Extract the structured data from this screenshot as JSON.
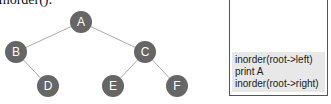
{
  "title": "Inorder():",
  "tree": {
    "nodes": [
      {
        "id": "A",
        "x": 81,
        "y": 22
      },
      {
        "id": "B",
        "x": 16,
        "y": 52
      },
      {
        "id": "C",
        "x": 145,
        "y": 52
      },
      {
        "id": "D",
        "x": 48,
        "y": 86
      },
      {
        "id": "E",
        "x": 113,
        "y": 86
      },
      {
        "id": "F",
        "x": 177,
        "y": 86
      }
    ],
    "edges": [
      [
        "A",
        "B"
      ],
      [
        "A",
        "C"
      ],
      [
        "B",
        "D"
      ],
      [
        "C",
        "E"
      ],
      [
        "C",
        "F"
      ]
    ],
    "node_color": "#666666",
    "edge_color": "#aaaaaa"
  },
  "stack": {
    "frame_lines": [
      "inorder(root->left)",
      "print A",
      "inorder(root->right)"
    ]
  }
}
